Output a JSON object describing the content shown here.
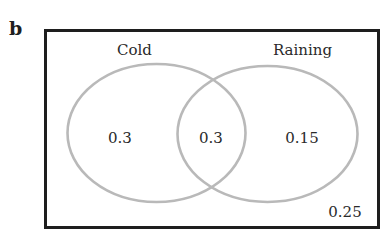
{
  "panel_label": "b",
  "diagram": {
    "type": "venn",
    "sets": [
      {
        "name": "Cold",
        "only_value": "0.3"
      },
      {
        "name": "Raining",
        "only_value": "0.15"
      }
    ],
    "intersection_value": "0.3",
    "outside_value": "0.25",
    "colors": {
      "border": "#1e1e1e",
      "circle_stroke": "#b9b9b9",
      "text": "#2a2a2a"
    }
  }
}
